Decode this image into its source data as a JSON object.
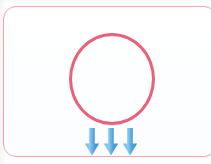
{
  "image": {
    "kind": "scanned-diagram-card",
    "width": 211,
    "height": 164,
    "background_color": "#fefefe",
    "alt_text": ""
  },
  "card": {
    "border_color": "#f2a6b0",
    "fill_color": "#fdfeff",
    "corner_radius": 13,
    "bleeds_off_right_edge": true
  },
  "shapes": {
    "circle": {
      "label": "",
      "stroke_color": "#e8576f",
      "stroke_width": 3,
      "fill": "none",
      "center_x": 108,
      "center_y": 72,
      "radius_x": 43,
      "radius_y": 46
    },
    "arrows": {
      "count": 3,
      "direction": "down",
      "color": "#4a9fdc",
      "highlight_color": "#7fc2ea",
      "positions_x": [
        88,
        107,
        126
      ],
      "top_y": 121,
      "bottom_y": 149,
      "labels": [
        "",
        "",
        ""
      ]
    }
  },
  "annotations": {
    "title": "",
    "caption": "",
    "legend": []
  }
}
